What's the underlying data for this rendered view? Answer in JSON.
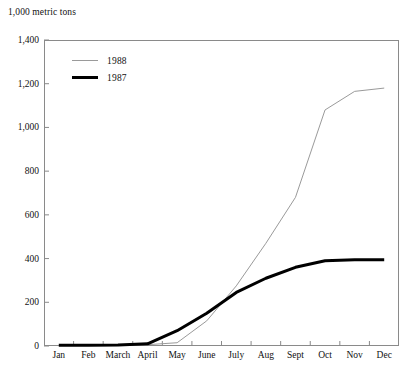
{
  "chart_data": {
    "type": "line",
    "title": "",
    "unit_label": "1,000 metric tons",
    "xlabel": "",
    "ylabel": "",
    "categories": [
      "Jan",
      "Feb",
      "March",
      "April",
      "May",
      "June",
      "July",
      "Aug",
      "Sept",
      "Oct",
      "Nov",
      "Dec"
    ],
    "ylim": [
      0,
      1400
    ],
    "y_ticks": [
      0,
      200,
      400,
      600,
      800,
      1000,
      1200,
      1400
    ],
    "y_tick_labels": [
      "0",
      "200",
      "400",
      "600",
      "800",
      "1,000",
      "1,200",
      "1,400"
    ],
    "grid": false,
    "legend_position": "upper-left-inside",
    "series": [
      {
        "name": "1988",
        "color": "#9a9a9a",
        "line_width": 1,
        "values": [
          2,
          3,
          4,
          6,
          15,
          115,
          275,
          470,
          680,
          1080,
          1165,
          1180
        ]
      },
      {
        "name": "1987",
        "color": "#000000",
        "line_width": 3,
        "values": [
          3,
          4,
          5,
          10,
          70,
          150,
          245,
          310,
          360,
          390,
          395,
          395
        ]
      }
    ]
  },
  "legend": {
    "items": [
      {
        "label": "1988",
        "style": "thin"
      },
      {
        "label": "1987",
        "style": "thick"
      }
    ]
  }
}
